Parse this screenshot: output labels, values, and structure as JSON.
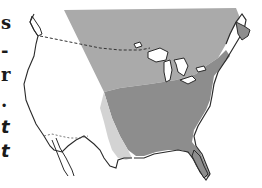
{
  "page": {
    "type": "book-page-map-figure"
  },
  "left_text_fragments": [
    {
      "text": "s",
      "style": "bold"
    },
    {
      "text": "-",
      "style": "bold"
    },
    {
      "text": "r",
      "style": "bold"
    },
    {
      "text": ".",
      "style": "bold"
    },
    {
      "text": "t",
      "style": "italic"
    },
    {
      "text": "t",
      "style": "italic"
    }
  ],
  "map": {
    "subject": "North America (United States and southern Canada)",
    "regions": [
      {
        "name": "northern-zone",
        "color": "#a9a9a9"
      },
      {
        "name": "eastern-zone",
        "color": "#8c8c8c"
      },
      {
        "name": "southern-plains-zone",
        "color": "#d2d2d2"
      }
    ],
    "boundary_styles": {
      "coastline": "#2a2a2a",
      "international_border": "dashed"
    }
  }
}
